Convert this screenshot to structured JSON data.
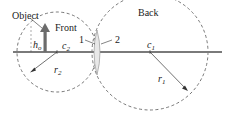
{
  "diagram": {
    "labels": {
      "object": "Object",
      "front": "Front",
      "back": "Back",
      "surface_1": "1",
      "surface_2": "2",
      "object_height": "h",
      "object_height_sub": "o",
      "center_2": "c",
      "center_2_sub": "2",
      "center_1": "c",
      "center_1_sub": "1",
      "radius_2": "r",
      "radius_2_sub": "2",
      "radius_1": "r",
      "radius_1_sub": "1"
    },
    "colors": {
      "axis": "#7a7a7a",
      "object_arrow": "#6b6b6b",
      "dashed_circles": "#555555",
      "lens_fill": "#e8e8e8",
      "lens_stroke": "#9a9a9a",
      "text": "#222222"
    },
    "elements": {
      "optical_axis": {
        "x1": 13,
        "x2": 222,
        "y": 52
      },
      "front_circle": {
        "cx": 57,
        "cy": 52,
        "r": 40
      },
      "back_circle": {
        "cx": 150,
        "cy": 52,
        "r": 58
      },
      "lens": {
        "x": 97,
        "top": 30,
        "bottom": 75
      },
      "object_arrow": {
        "x": 45,
        "base_y": 52,
        "tip_y": 24
      }
    }
  }
}
